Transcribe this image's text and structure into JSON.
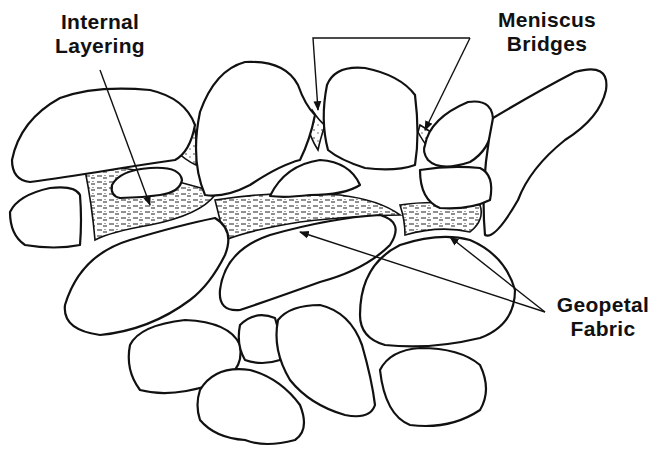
{
  "figure": {
    "type": "cement fabric diagram",
    "background": "#ffffff",
    "line_color": "#111111"
  },
  "labels": {
    "internal_layering": {
      "line1": "Internal",
      "line2": "Layering"
    },
    "meniscus_bridges": {
      "line1": "Meniscus",
      "line2": "Bridges"
    },
    "geopetal_fabric": {
      "line1": "Geopetal",
      "line2": "Fabric"
    }
  },
  "arrows": [
    {
      "label": "Internal Layering",
      "from": [
        100,
        70
      ],
      "to": [
        150,
        205
      ]
    },
    {
      "label": "Meniscus Bridges",
      "from": [
        470,
        38
      ],
      "to": [
        318,
        110
      ]
    },
    {
      "label": "Meniscus Bridges",
      "from": [
        470,
        38
      ],
      "to": [
        425,
        130
      ]
    },
    {
      "label": "Geopetal Fabric",
      "from": [
        545,
        312
      ],
      "to": [
        300,
        232
      ]
    },
    {
      "label": "Geopetal Fabric",
      "from": [
        545,
        312
      ],
      "to": [
        450,
        237
      ]
    }
  ]
}
